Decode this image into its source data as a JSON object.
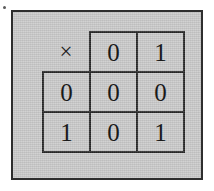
{
  "figure": {
    "caption": "",
    "background_color": "#c9c9c9",
    "frame_color": "#2e2e2e",
    "ink_color": "#1a1a1a"
  },
  "table": {
    "kind": "multiplication-table",
    "operator": "×",
    "column_headers": [
      "0",
      "1"
    ],
    "row_headers": [
      "0",
      "1"
    ],
    "rows": [
      {
        "header": "0",
        "cells": [
          "0",
          "0"
        ]
      },
      {
        "header": "1",
        "cells": [
          "0",
          "1"
        ]
      }
    ],
    "grid": [
      [
        "×",
        "0",
        "1"
      ],
      [
        "0",
        "0",
        "0"
      ],
      [
        "1",
        "0",
        "1"
      ]
    ]
  },
  "artifacts": {
    "speck_label": "ink-speck"
  }
}
